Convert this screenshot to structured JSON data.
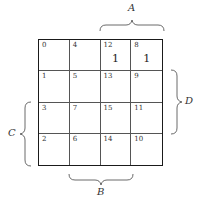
{
  "diagram": {
    "type": "karnaugh-map",
    "variables": [
      "A",
      "B",
      "C",
      "D"
    ],
    "labels": {
      "A": "A",
      "B": "B",
      "C": "C",
      "D": "D"
    },
    "cells": [
      [
        {
          "index": "0",
          "value": ""
        },
        {
          "index": "4",
          "value": ""
        },
        {
          "index": "12",
          "value": "1"
        },
        {
          "index": "8",
          "value": "1"
        }
      ],
      [
        {
          "index": "1",
          "value": ""
        },
        {
          "index": "5",
          "value": ""
        },
        {
          "index": "13",
          "value": ""
        },
        {
          "index": "9",
          "value": ""
        }
      ],
      [
        {
          "index": "3",
          "value": ""
        },
        {
          "index": "7",
          "value": ""
        },
        {
          "index": "15",
          "value": ""
        },
        {
          "index": "11",
          "value": ""
        }
      ],
      [
        {
          "index": "2",
          "value": ""
        },
        {
          "index": "6",
          "value": ""
        },
        {
          "index": "14",
          "value": ""
        },
        {
          "index": "10",
          "value": ""
        }
      ]
    ]
  }
}
